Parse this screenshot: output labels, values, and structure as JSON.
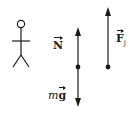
{
  "diagram": {
    "type": "free-body-diagram",
    "colors": {
      "stroke": "#1a1a1a",
      "background": "#ffffff"
    },
    "figure": {
      "icon": "stick-figure-person"
    },
    "left_body": {
      "forces": [
        {
          "name": "normal-force",
          "symbol": "N",
          "direction": "up"
        },
        {
          "name": "gravity-force",
          "prefix": "m",
          "symbol": "g",
          "direction": "down"
        }
      ]
    },
    "right_body": {
      "forces": [
        {
          "name": "force-j",
          "symbol": "F",
          "subscript": "j",
          "direction": "up"
        }
      ]
    }
  }
}
